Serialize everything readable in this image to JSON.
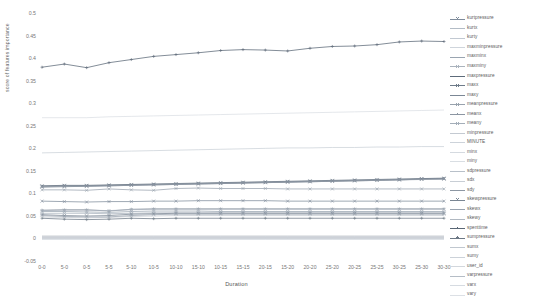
{
  "chart_data": {
    "type": "line",
    "title": "",
    "xlabel": "Duration",
    "ylabel": "score of features importance",
    "grid": false,
    "legend_position": "right",
    "ylim": [
      -0.05,
      0.5
    ],
    "yticks": [
      "0.5",
      "0.45",
      "0.4",
      "0.35",
      "0.3",
      "0.25",
      "0.2",
      "0.15",
      "0.1",
      "0.05",
      "0",
      "-0.05"
    ],
    "ytick_values": [
      0.5,
      0.45,
      0.4,
      0.35,
      0.3,
      0.25,
      0.2,
      0.15,
      0.1,
      0.05,
      0,
      -0.05
    ],
    "categories": [
      "0-0",
      "5-0",
      "0-5",
      "5-5",
      "5-10",
      "10-5",
      "10-10",
      "15-10",
      "10-15",
      "15-15",
      "20-15",
      "15-20",
      "20-20",
      "25-20",
      "20-25",
      "25-25",
      "30-25",
      "25-30",
      "30-30"
    ],
    "series": [
      {
        "name": "kurtpressure",
        "color": "#7f8c9b",
        "marker": "x",
        "values": [
          0.085,
          0.084,
          0.083,
          0.084,
          0.084,
          0.085,
          0.085,
          0.086,
          0.086,
          0.086,
          0.086,
          0.085,
          0.085,
          0.085,
          0.085,
          0.085,
          0.085,
          0.085,
          0.085
        ]
      },
      {
        "name": "kurtx",
        "color": "#b3bcc6",
        "marker": "none",
        "values": [
          0.006,
          0.006,
          0.006,
          0.006,
          0.006,
          0.006,
          0.006,
          0.006,
          0.006,
          0.006,
          0.006,
          0.006,
          0.006,
          0.006,
          0.006,
          0.006,
          0.006,
          0.006,
          0.006
        ]
      },
      {
        "name": "kurty",
        "color": "#c2c9d2",
        "marker": "none",
        "values": [
          0.005,
          0.005,
          0.005,
          0.005,
          0.005,
          0.005,
          0.005,
          0.005,
          0.005,
          0.005,
          0.005,
          0.005,
          0.005,
          0.005,
          0.005,
          0.005,
          0.005,
          0.005,
          0.005
        ]
      },
      {
        "name": "maxminpressure",
        "color": "#cfd5dc",
        "marker": "none",
        "values": [
          0.004,
          0.004,
          0.004,
          0.004,
          0.004,
          0.004,
          0.004,
          0.004,
          0.004,
          0.004,
          0.004,
          0.004,
          0.004,
          0.004,
          0.004,
          0.004,
          0.004,
          0.004,
          0.004
        ]
      },
      {
        "name": "maxminx",
        "color": "#9aa5b1",
        "marker": "x",
        "values": [
          0.062,
          0.062,
          0.061,
          0.06,
          0.062,
          0.063,
          0.063,
          0.063,
          0.062,
          0.062,
          0.062,
          0.062,
          0.062,
          0.062,
          0.062,
          0.062,
          0.062,
          0.062,
          0.062
        ]
      },
      {
        "name": "maxminy",
        "color": "#aab3bd",
        "marker": "x",
        "values": [
          0.058,
          0.058,
          0.058,
          0.057,
          0.058,
          0.059,
          0.059,
          0.059,
          0.059,
          0.059,
          0.059,
          0.059,
          0.059,
          0.059,
          0.059,
          0.059,
          0.059,
          0.059,
          0.059
        ]
      },
      {
        "name": "maxpressure",
        "color": "#5d6b7a",
        "marker": "x",
        "values": [
          0.119,
          0.12,
          0.12,
          0.121,
          0.122,
          0.123,
          0.124,
          0.125,
          0.126,
          0.127,
          0.128,
          0.129,
          0.13,
          0.131,
          0.132,
          0.133,
          0.134,
          0.135,
          0.136
        ]
      },
      {
        "name": "maxx",
        "color": "#6e7b89",
        "marker": "x",
        "values": [
          0.118,
          0.119,
          0.119,
          0.12,
          0.121,
          0.121,
          0.122,
          0.123,
          0.124,
          0.125,
          0.126,
          0.127,
          0.128,
          0.129,
          0.13,
          0.131,
          0.132,
          0.134,
          0.135
        ]
      },
      {
        "name": "maxy",
        "color": "#7b8795",
        "marker": "x",
        "values": [
          0.116,
          0.117,
          0.118,
          0.119,
          0.12,
          0.122,
          0.123,
          0.124,
          0.125,
          0.126,
          0.127,
          0.128,
          0.129,
          0.13,
          0.131,
          0.132,
          0.133,
          0.134,
          0.134
        ]
      },
      {
        "name": "meanpressure",
        "color": "#98a2ad",
        "marker": "x",
        "values": [
          0.11,
          0.11,
          0.109,
          0.112,
          0.11,
          0.109,
          0.113,
          0.114,
          0.113,
          0.113,
          0.113,
          0.112,
          0.112,
          0.112,
          0.112,
          0.112,
          0.112,
          0.112,
          0.112
        ]
      },
      {
        "name": "meanx",
        "color": "#8c96a2",
        "marker": "+",
        "values": [
          0.065,
          0.066,
          0.066,
          0.063,
          0.067,
          0.068,
          0.068,
          0.068,
          0.068,
          0.068,
          0.068,
          0.068,
          0.068,
          0.068,
          0.068,
          0.068,
          0.068,
          0.068,
          0.068
        ]
      },
      {
        "name": "meany",
        "color": "#a4aeb9",
        "marker": "x",
        "values": [
          0.064,
          0.065,
          0.065,
          0.064,
          0.066,
          0.067,
          0.067,
          0.067,
          0.067,
          0.067,
          0.067,
          0.067,
          0.067,
          0.067,
          0.067,
          0.067,
          0.067,
          0.067,
          0.067
        ]
      },
      {
        "name": "minpressure",
        "color": "#c4cad2",
        "marker": "none",
        "values": [
          0.008,
          0.008,
          0.008,
          0.008,
          0.008,
          0.008,
          0.008,
          0.008,
          0.008,
          0.008,
          0.008,
          0.008,
          0.008,
          0.008,
          0.008,
          0.008,
          0.008,
          0.008,
          0.008
        ]
      },
      {
        "name": "MINUTE",
        "color": "#cdd3da",
        "marker": "none",
        "values": [
          0.27,
          0.27,
          0.27,
          0.272,
          0.273,
          0.274,
          0.275,
          0.276,
          0.277,
          0.278,
          0.279,
          0.28,
          0.281,
          0.282,
          0.283,
          0.284,
          0.285,
          0.286,
          0.287
        ]
      },
      {
        "name": "minx",
        "color": "#d5dae0",
        "marker": "none",
        "values": [
          0.003,
          0.003,
          0.003,
          0.003,
          0.003,
          0.003,
          0.003,
          0.003,
          0.003,
          0.003,
          0.003,
          0.003,
          0.003,
          0.003,
          0.003,
          0.003,
          0.003,
          0.003,
          0.003
        ]
      },
      {
        "name": "miny",
        "color": "#d9dee3",
        "marker": "none",
        "values": [
          0.002,
          0.002,
          0.002,
          0.002,
          0.002,
          0.002,
          0.002,
          0.002,
          0.002,
          0.002,
          0.002,
          0.002,
          0.002,
          0.002,
          0.002,
          0.002,
          0.002,
          0.002,
          0.002
        ]
      },
      {
        "name": "sdpressure",
        "color": "#b8c0c9",
        "marker": "none",
        "values": [
          0.192,
          0.193,
          0.194,
          0.195,
          0.196,
          0.197,
          0.198,
          0.199,
          0.2,
          0.201,
          0.202,
          0.203,
          0.203,
          0.204,
          0.204,
          0.205,
          0.205,
          0.206,
          0.206
        ]
      },
      {
        "name": "sdx",
        "color": "#c8ced5",
        "marker": "none",
        "values": [
          0.007,
          0.007,
          0.007,
          0.007,
          0.007,
          0.007,
          0.007,
          0.007,
          0.007,
          0.007,
          0.007,
          0.007,
          0.007,
          0.007,
          0.007,
          0.007,
          0.007,
          0.007,
          0.007
        ]
      },
      {
        "name": "sdy",
        "color": "#8d97a3",
        "marker": "x",
        "values": [
          0.117,
          0.118,
          0.118,
          0.119,
          0.12,
          0.121,
          0.122,
          0.123,
          0.124,
          0.125,
          0.126,
          0.127,
          0.128,
          0.129,
          0.13,
          0.131,
          0.132,
          0.133,
          0.134
        ]
      },
      {
        "name": "skewpressure",
        "color": "#7a8693",
        "marker": "x",
        "values": [
          0.055,
          0.053,
          0.052,
          0.053,
          0.056,
          0.057,
          0.058,
          0.058,
          0.058,
          0.058,
          0.058,
          0.058,
          0.058,
          0.058,
          0.058,
          0.058,
          0.058,
          0.058,
          0.058
        ]
      },
      {
        "name": "skewx",
        "color": "#98a2ae",
        "marker": "x",
        "values": [
          0.053,
          0.051,
          0.05,
          0.05,
          0.053,
          0.055,
          0.056,
          0.056,
          0.056,
          0.056,
          0.056,
          0.056,
          0.056,
          0.056,
          0.056,
          0.056,
          0.056,
          0.056,
          0.056
        ]
      },
      {
        "name": "skewy",
        "color": "#b0b8c1",
        "marker": "none",
        "values": [
          0.05,
          0.049,
          0.048,
          0.049,
          0.051,
          0.052,
          0.053,
          0.053,
          0.053,
          0.053,
          0.053,
          0.053,
          0.053,
          0.053,
          0.053,
          0.053,
          0.053,
          0.053,
          0.053
        ]
      },
      {
        "name": "spenttime",
        "color": "#5a6775",
        "marker": "+",
        "values": [
          0.382,
          0.389,
          0.381,
          0.392,
          0.399,
          0.406,
          0.41,
          0.414,
          0.419,
          0.421,
          0.42,
          0.418,
          0.424,
          0.428,
          0.429,
          0.432,
          0.438,
          0.44,
          0.439
        ]
      },
      {
        "name": "sumpressure",
        "color": "#6c7885",
        "marker": "+",
        "values": [
          0.047,
          0.045,
          0.044,
          0.045,
          0.047,
          0.046,
          0.047,
          0.047,
          0.047,
          0.047,
          0.047,
          0.047,
          0.047,
          0.047,
          0.047,
          0.047,
          0.047,
          0.047,
          0.047
        ]
      },
      {
        "name": "sumx",
        "color": "#c0c7cf",
        "marker": "none",
        "values": [
          0.004,
          0.004,
          0.004,
          0.004,
          0.004,
          0.004,
          0.004,
          0.004,
          0.004,
          0.004,
          0.004,
          0.004,
          0.004,
          0.004,
          0.004,
          0.004,
          0.004,
          0.004,
          0.004
        ]
      },
      {
        "name": "sumy",
        "color": "#ccd2d9",
        "marker": "none",
        "values": [
          0.003,
          0.003,
          0.003,
          0.003,
          0.003,
          0.003,
          0.003,
          0.003,
          0.003,
          0.003,
          0.003,
          0.003,
          0.003,
          0.003,
          0.003,
          0.003,
          0.003,
          0.003,
          0.003
        ]
      },
      {
        "name": "user_id",
        "color": "#d2d7dd",
        "marker": "none",
        "values": [
          0.002,
          0.002,
          0.002,
          0.002,
          0.002,
          0.002,
          0.002,
          0.002,
          0.002,
          0.002,
          0.002,
          0.002,
          0.002,
          0.002,
          0.002,
          0.002,
          0.002,
          0.002,
          0.002
        ]
      },
      {
        "name": "varpressure",
        "color": "#b5bdc6",
        "marker": "none",
        "values": [
          0.001,
          0.001,
          0.001,
          0.001,
          0.001,
          0.001,
          0.001,
          0.001,
          0.001,
          0.001,
          0.001,
          0.001,
          0.001,
          0.001,
          0.001,
          0.001,
          0.001,
          0.001,
          0.001
        ]
      },
      {
        "name": "varx",
        "color": "#d6dbe1",
        "marker": "none",
        "values": [
          0.001,
          0.001,
          0.001,
          0.001,
          0.001,
          0.001,
          0.001,
          0.001,
          0.001,
          0.001,
          0.001,
          0.001,
          0.001,
          0.001,
          0.001,
          0.001,
          0.001,
          0.001,
          0.001
        ]
      },
      {
        "name": "vary",
        "color": "#dce0e5",
        "marker": "none",
        "values": [
          0.0,
          0.0,
          0.0,
          0.0,
          0.0,
          0.0,
          0.0,
          0.0,
          0.0,
          0.0,
          0.0,
          0.0,
          0.0,
          0.0,
          0.0,
          0.0,
          0.0,
          0.0,
          0.0
        ]
      }
    ]
  }
}
